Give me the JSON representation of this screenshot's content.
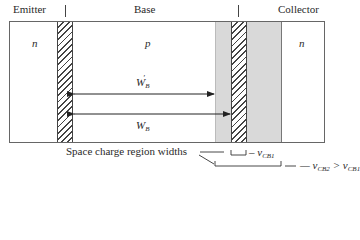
{
  "figure": {
    "regions": [
      {
        "name": "Emitter",
        "doping": "n"
      },
      {
        "name": "Base",
        "doping": "p"
      },
      {
        "name": "Collector",
        "doping": "n"
      }
    ],
    "arrows": [
      {
        "label_main": "W",
        "label_sub": "B",
        "label_prime": "′",
        "description": "effective base width at higher V_CB"
      },
      {
        "label_main": "W",
        "label_sub": "B",
        "label_prime": "",
        "description": "base width at lower V_CB"
      }
    ],
    "annotation": {
      "caption": "Space charge region widths",
      "bracket1_label_prefix": "– v",
      "bracket1_label_sub": "CB1",
      "bracket2_label_prefix": "— v",
      "bracket2_label_sub1": "CB2",
      "bracket2_label_mid": " > v",
      "bracket2_label_sub2": "CB1"
    },
    "colors": {
      "outline": "#666666",
      "space_charge_gray": "#d9d9d9",
      "hatch": "#444444",
      "arrow": "#222222"
    }
  }
}
